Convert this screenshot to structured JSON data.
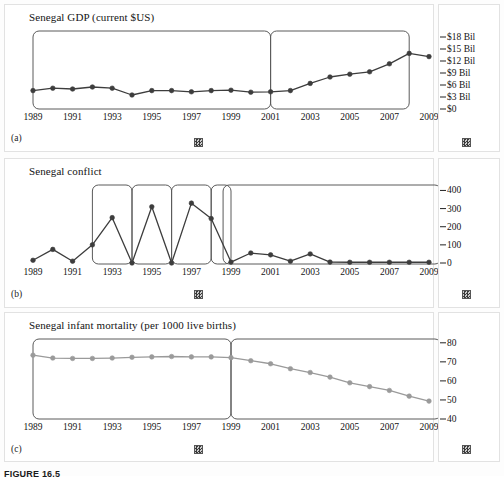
{
  "figure": {
    "caption": "FIGURE 16.5",
    "panel_letters": [
      "(a)",
      "(b)",
      "(c)"
    ],
    "glyph_name": "checkered-square-glyph"
  },
  "chart_data": [
    {
      "type": "line",
      "panel": "(a)",
      "title": "Senegal GDP (current $US)",
      "xlabel": "",
      "ylabel": "",
      "grid": false,
      "legend": "none",
      "x": [
        1989,
        1990,
        1991,
        1992,
        1993,
        1994,
        1995,
        1996,
        1997,
        1998,
        1999,
        2000,
        2001,
        2002,
        2003,
        2004,
        2005,
        2006,
        2007,
        2008,
        2009
      ],
      "xtick_labels": [
        "1989",
        "1991",
        "1993",
        "1995",
        "1997",
        "1999",
        "2001",
        "2003",
        "2005",
        "2007",
        "2009"
      ],
      "ytick_labels": [
        "$18 Bil",
        "$15 Bil",
        "$12 Bil",
        "$9 Bil",
        "$6 Bil",
        "$3 Bil",
        "$0"
      ],
      "ytick_values": [
        18,
        15,
        12,
        9,
        6,
        3,
        0
      ],
      "ylim": [
        0,
        19.5
      ],
      "xlim": [
        1989,
        2009
      ],
      "values": [
        4.6,
        5.2,
        5.0,
        5.5,
        5.2,
        3.5,
        4.6,
        4.6,
        4.3,
        4.6,
        4.7,
        4.2,
        4.3,
        4.6,
        6.4,
        8.0,
        8.7,
        9.3,
        11.3,
        13.9,
        13.1
      ],
      "series_color": "#3d3d3d",
      "marker": "filled-circle",
      "highlight_boxes": [
        {
          "x_start": 1989,
          "x_end": 2001,
          "label": "highlight-box-1989-2001"
        },
        {
          "x_start": 2001,
          "x_end": 2008,
          "label": "highlight-box-2001-2008"
        }
      ]
    },
    {
      "type": "line",
      "panel": "(b)",
      "title": "Senegal conflict",
      "xlabel": "",
      "ylabel": "",
      "grid": false,
      "legend": "none",
      "x": [
        1989,
        1990,
        1991,
        1992,
        1993,
        1994,
        1995,
        1996,
        1997,
        1998,
        1999,
        2000,
        2001,
        2002,
        2003,
        2004,
        2005,
        2006,
        2007,
        2008,
        2009
      ],
      "xtick_labels": [
        "1989",
        "1991",
        "1993",
        "1995",
        "1997",
        "1999",
        "2001",
        "2003",
        "2005",
        "2007",
        "2009"
      ],
      "ytick_labels": [
        "400",
        "300",
        "200",
        "100",
        "0"
      ],
      "ytick_values": [
        400,
        300,
        200,
        100,
        0
      ],
      "ylim": [
        0,
        430
      ],
      "xlim": [
        1989,
        2009
      ],
      "values": [
        15,
        75,
        10,
        100,
        250,
        0,
        310,
        0,
        330,
        245,
        5,
        55,
        45,
        10,
        50,
        5,
        4,
        4,
        4,
        4,
        4
      ],
      "series_color": "#3d3d3d",
      "marker": "filled-circle",
      "highlight_boxes": [
        {
          "x_start": 1992,
          "x_end": 1994,
          "label": "highlight-box-1992-1994"
        },
        {
          "x_start": 1994,
          "x_end": 1996,
          "label": "highlight-box-1994-1996"
        },
        {
          "x_start": 1996,
          "x_end": 1998,
          "label": "highlight-box-1996-1998"
        },
        {
          "x_start": 1998,
          "x_end": 1999,
          "label": "highlight-box-1998-1999"
        },
        {
          "x_start": 1998.6,
          "x_end": 2009.6,
          "label": "highlight-box-1999-2009"
        }
      ]
    },
    {
      "type": "line",
      "panel": "(c)",
      "title": "Senegal infant mortality (per 1000 live births)",
      "xlabel": "",
      "ylabel": "",
      "grid": false,
      "legend": "none",
      "x": [
        1989,
        1990,
        1991,
        1992,
        1993,
        1994,
        1995,
        1996,
        1997,
        1998,
        1999,
        2000,
        2001,
        2002,
        2003,
        2004,
        2005,
        2006,
        2007,
        2008,
        2009
      ],
      "xtick_labels": [
        "1989",
        "1991",
        "1993",
        "1995",
        "1997",
        "1999",
        "2001",
        "2003",
        "2005",
        "2007",
        "2009"
      ],
      "ytick_labels": [
        "80",
        "70",
        "60",
        "50",
        "40"
      ],
      "ytick_values": [
        80,
        70,
        60,
        50,
        40
      ],
      "ylim": [
        40,
        82
      ],
      "xlim": [
        1989,
        2009
      ],
      "values": [
        73.5,
        72,
        71.8,
        71.8,
        72,
        72.4,
        72.6,
        72.8,
        72.6,
        72.6,
        72.2,
        70.6,
        69,
        66.4,
        64.4,
        62,
        59,
        57,
        55,
        52,
        49.4
      ],
      "series_color": "#9a9a9a",
      "marker": "filled-circle",
      "highlight_boxes": [
        {
          "x_start": 1989,
          "x_end": 1999,
          "label": "highlight-box-1989-1999"
        },
        {
          "x_start": 1999,
          "x_end": 2009.6,
          "label": "highlight-box-1999-2009"
        }
      ]
    }
  ]
}
